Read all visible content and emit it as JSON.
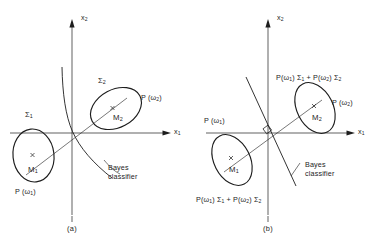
{
  "figure": {
    "panels": [
      {
        "id": "a",
        "caption": "(a)",
        "axes": {
          "x_label": "x",
          "x_sub": "1",
          "y_label": "x",
          "y_sub": "2"
        },
        "classes": [
          {
            "covariance_label": "Σ",
            "covariance_sub": "1",
            "mean_label": "M",
            "mean_sub": "1",
            "prior_label": "P (ω",
            "prior_sub": "1",
            "prior_close": ")"
          },
          {
            "covariance_label": "Σ",
            "covariance_sub": "2",
            "mean_label": "M",
            "mean_sub": "2",
            "prior_label": "P (ω",
            "prior_sub": "2",
            "prior_close": ")"
          }
        ],
        "boundary": {
          "label_line1": "Bayes",
          "label_line2": "classifier",
          "shape": "quadratic-hyperbolic-curve"
        }
      },
      {
        "id": "b",
        "caption": "(b)",
        "axes": {
          "x_label": "x",
          "x_sub": "1",
          "y_label": "x",
          "y_sub": "2"
        },
        "classes": [
          {
            "mean_label": "M",
            "mean_sub": "1",
            "prior_label": "P (ω",
            "prior_sub": "1",
            "prior_close": ")"
          },
          {
            "mean_label": "M",
            "mean_sub": "2",
            "prior_label": "P (ω",
            "prior_sub": "2",
            "prior_close": ")"
          }
        ],
        "pooled_covariance": {
          "text_a": "P(ω",
          "sub_a": "1",
          "text_b": ") Σ",
          "sub_b": "1",
          "text_c": " + P(ω",
          "sub_c": "2",
          "text_d": ") Σ",
          "sub_d": "2"
        },
        "boundary": {
          "label_line1": "Bayes",
          "label_line2": "classifier",
          "shape": "straight-line",
          "right_angle_marker": true
        }
      }
    ]
  },
  "style": {
    "stroke_color": "#1d1d1d",
    "background_color": "#ffffff"
  }
}
